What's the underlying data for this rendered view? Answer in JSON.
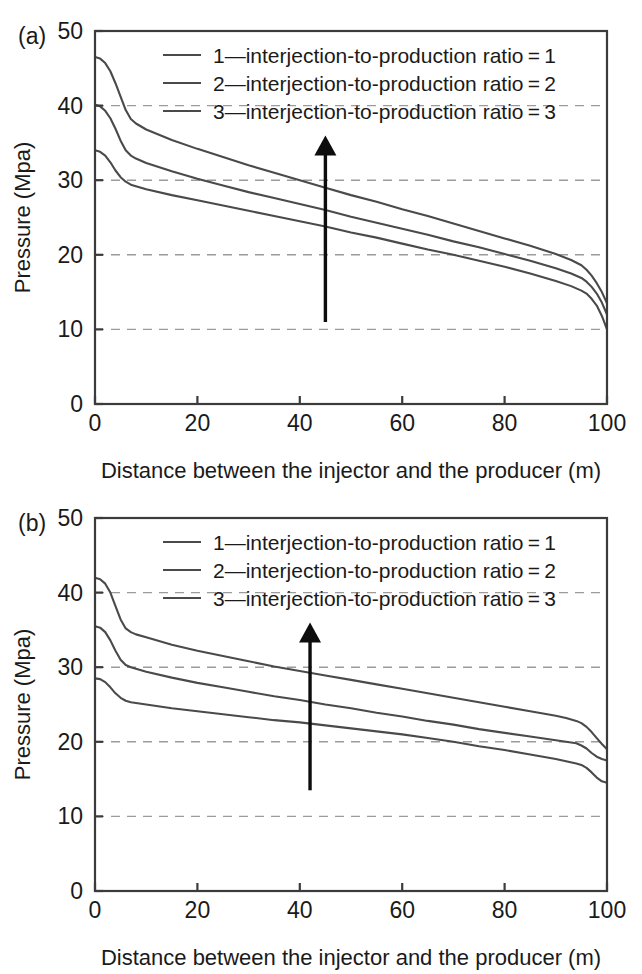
{
  "figure": {
    "panels": [
      "a",
      "b"
    ]
  },
  "chart_data": [
    {
      "type": "line",
      "panel_label": "(a)",
      "title": "",
      "xlabel": "Distance between the injector and the producer (m)",
      "ylabel": "Pressure (Mpa)",
      "xlim": [
        0,
        100
      ],
      "ylim": [
        0,
        50
      ],
      "xticks": [
        0,
        20,
        40,
        60,
        80,
        100
      ],
      "yticks": [
        0,
        10,
        20,
        30,
        40,
        50
      ],
      "xtick_labels": [
        "0",
        "20",
        "40",
        "60",
        "80",
        "100"
      ],
      "ytick_labels": [
        "0",
        "10",
        "20",
        "30",
        "40",
        "50"
      ],
      "grid": true,
      "grid_axis": "y",
      "grid_values": [
        10,
        20,
        30,
        40
      ],
      "legend_position": "top-center",
      "legend": [
        "1—interjection-to-production ratio = 1",
        "2—interjection-to-production ratio = 2",
        "3—interjection-to-production ratio = 3"
      ],
      "x": [
        0,
        1,
        2,
        3,
        4,
        5,
        6,
        7,
        8,
        10,
        15,
        20,
        25,
        30,
        35,
        40,
        45,
        50,
        55,
        60,
        65,
        70,
        75,
        80,
        85,
        90,
        93,
        95,
        96,
        97,
        98,
        99,
        100
      ],
      "series": [
        {
          "name": "3—interjection-to-production ratio = 3",
          "ratio": 3,
          "values": [
            46.5,
            46.3,
            45.7,
            44.6,
            43.0,
            41.2,
            39.4,
            38.2,
            37.6,
            36.8,
            35.4,
            34.2,
            33.1,
            32.0,
            31.0,
            30.0,
            29.0,
            28.0,
            27.1,
            26.1,
            25.2,
            24.2,
            23.2,
            22.2,
            21.2,
            20.1,
            19.3,
            18.6,
            18.0,
            17.2,
            16.2,
            15.0,
            13.5
          ]
        },
        {
          "name": "2—interjection-to-production ratio = 2",
          "ratio": 2,
          "values": [
            40.1,
            39.9,
            39.3,
            38.3,
            36.9,
            35.3,
            34.0,
            33.3,
            32.9,
            32.3,
            31.2,
            30.2,
            29.3,
            28.4,
            27.6,
            26.8,
            26.0,
            25.1,
            24.3,
            23.5,
            22.7,
            21.8,
            21.0,
            20.1,
            19.2,
            18.2,
            17.5,
            16.9,
            16.4,
            15.7,
            14.8,
            13.6,
            12.0
          ]
        },
        {
          "name": "1—interjection-to-production ratio = 1",
          "ratio": 1,
          "values": [
            34.0,
            33.8,
            33.3,
            32.4,
            31.3,
            30.4,
            29.8,
            29.4,
            29.2,
            28.8,
            28.0,
            27.3,
            26.6,
            25.9,
            25.2,
            24.5,
            23.8,
            23.0,
            22.3,
            21.5,
            20.7,
            20.0,
            19.2,
            18.4,
            17.5,
            16.5,
            15.8,
            15.2,
            14.8,
            14.1,
            13.2,
            11.8,
            10.0
          ]
        }
      ],
      "annotation": {
        "type": "arrow",
        "x": 45,
        "y_start": 11,
        "y_end": 36,
        "direction": "up"
      }
    },
    {
      "type": "line",
      "panel_label": "(b)",
      "title": "",
      "xlabel": "Distance between the injector and the producer (m)",
      "ylabel": "Pressure (Mpa)",
      "xlim": [
        0,
        100
      ],
      "ylim": [
        0,
        50
      ],
      "xticks": [
        0,
        20,
        40,
        60,
        80,
        100
      ],
      "yticks": [
        0,
        10,
        20,
        30,
        40,
        50
      ],
      "xtick_labels": [
        "0",
        "20",
        "40",
        "60",
        "80",
        "100"
      ],
      "ytick_labels": [
        "0",
        "10",
        "20",
        "30",
        "40",
        "50"
      ],
      "grid": true,
      "grid_axis": "y",
      "grid_values": [
        10,
        20,
        30,
        40
      ],
      "legend_position": "top-center",
      "legend": [
        "1—interjection-to-production ratio = 1",
        "2—interjection-to-production ratio = 2",
        "3—interjection-to-production ratio = 3"
      ],
      "x": [
        0,
        1,
        2,
        3,
        4,
        5,
        6,
        7,
        8,
        10,
        15,
        20,
        25,
        30,
        35,
        40,
        45,
        50,
        55,
        60,
        65,
        70,
        75,
        80,
        85,
        90,
        92,
        94,
        95,
        96,
        97,
        98,
        99,
        100
      ],
      "series": [
        {
          "name": "3—interjection-to-production ratio = 3",
          "ratio": 3,
          "values": [
            42.0,
            41.8,
            41.2,
            40.0,
            38.2,
            36.4,
            35.2,
            34.7,
            34.4,
            34.0,
            33.0,
            32.2,
            31.5,
            30.8,
            30.1,
            29.5,
            28.9,
            28.3,
            27.7,
            27.1,
            26.5,
            25.9,
            25.3,
            24.7,
            24.1,
            23.5,
            23.2,
            22.8,
            22.5,
            22.0,
            21.3,
            20.5,
            19.7,
            19.0
          ]
        },
        {
          "name": "2—interjection-to-production ratio = 2",
          "ratio": 2,
          "values": [
            35.5,
            35.3,
            34.7,
            33.6,
            32.2,
            31.0,
            30.3,
            30.0,
            29.8,
            29.4,
            28.6,
            27.9,
            27.3,
            26.7,
            26.1,
            25.6,
            25.0,
            24.5,
            23.9,
            23.4,
            22.8,
            22.3,
            21.7,
            21.2,
            20.7,
            20.2,
            20.0,
            19.8,
            19.5,
            19.1,
            18.5,
            18.0,
            17.7,
            17.5
          ]
        },
        {
          "name": "1—interjection-to-production ratio = 1",
          "ratio": 1,
          "values": [
            28.5,
            28.4,
            28.0,
            27.3,
            26.5,
            25.9,
            25.5,
            25.3,
            25.2,
            25.0,
            24.5,
            24.1,
            23.7,
            23.3,
            22.9,
            22.6,
            22.2,
            21.8,
            21.4,
            21.0,
            20.5,
            20.0,
            19.4,
            18.9,
            18.3,
            17.7,
            17.4,
            17.1,
            16.9,
            16.5,
            15.9,
            15.2,
            14.7,
            14.5
          ]
        }
      ],
      "annotation": {
        "type": "arrow",
        "x": 42,
        "y_start": 13.5,
        "y_end": 36,
        "direction": "up"
      }
    }
  ]
}
